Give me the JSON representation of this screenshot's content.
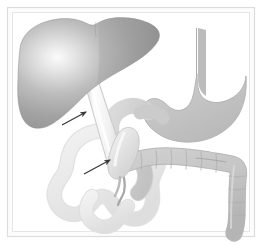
{
  "figure": {
    "title": "Hepatobiliary and gastrointestinal anatomy illustration",
    "description": "Grayscale medical line illustration of the liver, gallbladder, bile duct, stomach, duodenum, small intestine and colon, with two arrows indicating the common bile duct and the gallbladder region.",
    "style": "grayscale airbrush medical illustration"
  },
  "frame": {
    "outer_background": "#ffffff",
    "mat_color": "#fbfbfb",
    "border_color": "#d8d8d8",
    "inner_line_color": "#e3e3e3",
    "shadow_color": "#cfcfcf"
  },
  "palette": {
    "liver_dark": "#8e8e8e",
    "liver_mid": "#b4b4b4",
    "liver_highlight": "#f4f4f4",
    "liver_edge": "#8a8a8a",
    "stomach_fill": "#c2c2c2",
    "stomach_edge": "#b0b0b0",
    "colon_fill": "#c7c7c7",
    "colon_edge": "#b2b2b2",
    "duodenum_fill": "#cccccc",
    "small_intestine_fill": "#ececec",
    "small_intestine_edge": "#d4d4d4",
    "duct_light": "#fafafa",
    "duct_mid": "#e0e0e0",
    "duct_edge": "#cfcfcf",
    "gallbladder_fill": "#e6e6e6",
    "arrow_color": "#3a3a3a"
  },
  "organs": [
    {
      "id": "liver",
      "label": "Liver",
      "shade": "dark gradient gray",
      "position": "upper left"
    },
    {
      "id": "esophagus",
      "label": "Esophagus",
      "shade": "medium gray",
      "position": "upper right"
    },
    {
      "id": "stomach",
      "label": "Stomach",
      "shade": "medium gray",
      "position": "right"
    },
    {
      "id": "bile-duct",
      "label": "Common bile duct",
      "shade": "pale gradient",
      "position": "center diagonal"
    },
    {
      "id": "gallbladder",
      "label": "Gallbladder",
      "shade": "pale gray",
      "position": "center"
    },
    {
      "id": "duodenum",
      "label": "Duodenum",
      "shade": "light gray",
      "position": "center"
    },
    {
      "id": "pancreatic-duct",
      "label": "Pancreatic duct",
      "shade": "medium gray line",
      "position": "center lower"
    },
    {
      "id": "small-intestine",
      "label": "Small intestine (jejunum loops)",
      "shade": "very light gray",
      "position": "lower left"
    },
    {
      "id": "transverse-colon",
      "label": "Transverse colon",
      "shade": "medium gray haustrated",
      "position": "lower right"
    },
    {
      "id": "descending-colon",
      "label": "Descending colon",
      "shade": "medium gray haustrated",
      "position": "lower far right"
    }
  ],
  "annotations": [
    {
      "id": "arrow-bile-duct",
      "label": "Arrow indicating common bile duct",
      "tip_x": 86,
      "tip_y": 112,
      "tail_x": 64,
      "tail_y": 124,
      "color": "#3a3a3a"
    },
    {
      "id": "arrow-gallbladder",
      "label": "Arrow indicating gallbladder neck",
      "tip_x": 110,
      "tip_y": 160,
      "tail_x": 86,
      "tail_y": 173,
      "color": "#3a3a3a"
    }
  ]
}
